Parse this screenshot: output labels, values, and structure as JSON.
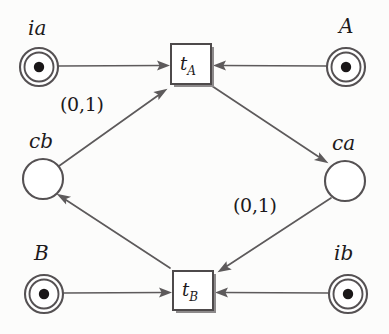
{
  "diagram": {
    "type": "petri-net",
    "title": "",
    "background_color": "#fcfcfb",
    "stroke_color": "#555153",
    "token_color": "#1a1718",
    "places": [
      {
        "id": "ia",
        "label": "ia",
        "cx": 39,
        "cy": 67,
        "r": 19,
        "tokens": 1,
        "double_ring": true,
        "label_x": 28,
        "label_y": 18
      },
      {
        "id": "A",
        "label": "A",
        "cx": 346,
        "cy": 67,
        "r": 19,
        "tokens": 1,
        "double_ring": true,
        "label_x": 339,
        "label_y": 16
      },
      {
        "id": "cb",
        "label": "cb",
        "cx": 43,
        "cy": 179,
        "r": 20,
        "tokens": 0,
        "double_ring": false,
        "label_x": 29,
        "label_y": 131
      },
      {
        "id": "ca",
        "label": "ca",
        "cx": 345,
        "cy": 181,
        "r": 20,
        "tokens": 0,
        "double_ring": false,
        "label_x": 332,
        "label_y": 133
      },
      {
        "id": "B",
        "label": "B",
        "cx": 44,
        "cy": 294,
        "r": 19,
        "tokens": 1,
        "double_ring": true,
        "label_x": 34,
        "label_y": 243
      },
      {
        "id": "ib",
        "label": "ib",
        "cx": 348,
        "cy": 294,
        "r": 19,
        "tokens": 1,
        "double_ring": true,
        "label_x": 334,
        "label_y": 243
      }
    ],
    "transitions": [
      {
        "id": "tA",
        "label": "t",
        "sub": "A",
        "x": 171,
        "y": 44,
        "w": 40,
        "h": 40,
        "label_x": 180,
        "label_y": 55
      },
      {
        "id": "tB",
        "label": "t",
        "sub": "B",
        "x": 173,
        "y": 271,
        "w": 40,
        "h": 39,
        "label_x": 182,
        "label_y": 281
      }
    ],
    "arcs": [
      {
        "id": "ia-tA",
        "from": "ia",
        "to": "tA",
        "label": ""
      },
      {
        "id": "A-tA",
        "from": "A",
        "to": "tA",
        "label": ""
      },
      {
        "id": "cb-tA",
        "from": "cb",
        "to": "tA",
        "label": "(0,1)",
        "label_x": 60,
        "label_y": 95
      },
      {
        "id": "tA-ca",
        "from": "tA",
        "to": "ca",
        "label": ""
      },
      {
        "id": "ca-tB",
        "from": "ca",
        "to": "tB",
        "label": "(0,1)",
        "label_x": 233,
        "label_y": 196
      },
      {
        "id": "tB-cb",
        "from": "tB",
        "to": "cb",
        "label": ""
      },
      {
        "id": "B-tB",
        "from": "B",
        "to": "tB",
        "label": ""
      },
      {
        "id": "ib-tB",
        "from": "ib",
        "to": "tB",
        "label": ""
      }
    ]
  }
}
